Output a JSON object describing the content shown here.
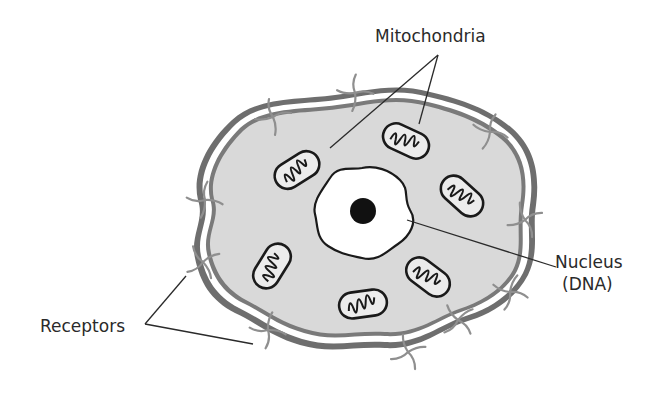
{
  "diagram": {
    "labels": {
      "mitochondria": "Mitochondria",
      "nucleus_line1": "Nucleus",
      "nucleus_line2": "(DNA)",
      "receptors": "Receptors"
    },
    "colors": {
      "background": "#ffffff",
      "cytoplasm": "#d9d9d9",
      "membrane": "#6e6e6e",
      "receptor": "#8f8f8f",
      "outline": "#1a1a1a",
      "nucleus_fill": "#ffffff",
      "nucleolus": "#111111",
      "leader_line": "#2a2a2a"
    },
    "components": [
      "cell membrane",
      "cytoplasm",
      "nucleus",
      "nucleolus",
      "mitochondria (6)",
      "receptors"
    ]
  }
}
